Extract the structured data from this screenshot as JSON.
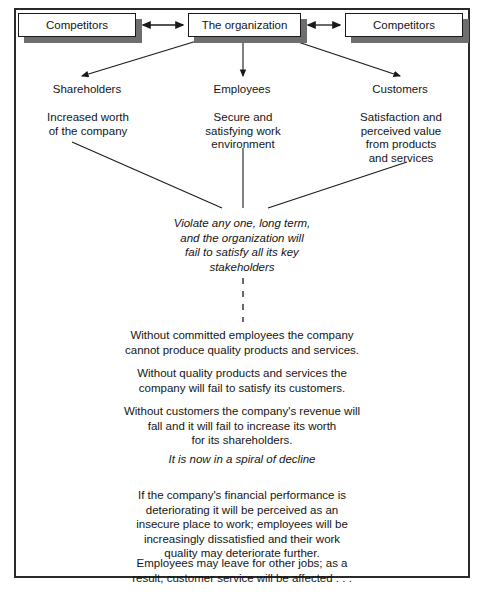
{
  "diagram": {
    "frame": {
      "border_color": "#2a2a2a"
    },
    "boxes": [
      {
        "id": "competitors-left",
        "label": "Competitors"
      },
      {
        "id": "the-organization",
        "label": "The organization"
      },
      {
        "id": "competitors-right",
        "label": "Competitors"
      }
    ],
    "stakeholders": [
      {
        "id": "shareholders",
        "label": "Shareholders",
        "description_lines": [
          "Increased worth",
          "of the company"
        ]
      },
      {
        "id": "employees",
        "label": "Employees",
        "description_lines": [
          "Secure and",
          "satisfying work",
          "environment"
        ]
      },
      {
        "id": "customers",
        "label": "Customers",
        "description_lines": [
          "Satisfaction and",
          "perceived value",
          "from products",
          "and services"
        ]
      }
    ],
    "key_statement_lines": [
      "Violate any one, long term,",
      "and the organization will",
      "fail to satisfy all its key",
      "stakeholders"
    ],
    "consequences": [
      {
        "id": "consequence-employees",
        "lines": [
          "Without committed employees the company",
          "cannot produce quality products and services."
        ]
      },
      {
        "id": "consequence-quality",
        "lines": [
          "Without quality products and services the",
          "company will fail to satisfy its customers."
        ]
      },
      {
        "id": "consequence-customers",
        "lines": [
          "Without customers the company's revenue will",
          "fall and it will fail to increase its worth",
          "for its shareholders."
        ]
      }
    ],
    "spiral_statement": "It is now in a spiral of decline",
    "consequences_after": [
      {
        "id": "consequence-financial",
        "lines": [
          "If the company's financial performance is",
          "deteriorating it will be perceived as an",
          "insecure place to work; employees will be",
          "increasingly dissatisfied and their work",
          "quality may deteriorate further."
        ]
      },
      {
        "id": "consequence-attrition",
        "lines": [
          "Employees may leave for other jobs; as a",
          "result, customer service will be affected . . ."
        ]
      }
    ],
    "colors": {
      "line": "#1a1a1a",
      "box_border": "#1a1a1a",
      "box_shadow": "#6e6e6e",
      "text": "#151515",
      "background": "#ffffff"
    }
  }
}
